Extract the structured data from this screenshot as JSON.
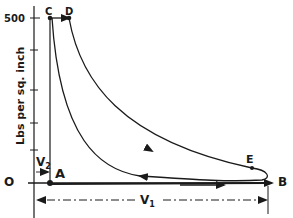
{
  "diagram": {
    "type": "pressure-volume indicator diagram",
    "y_axis": {
      "label": "Lbs per sq. inch",
      "tick_label_top": "500",
      "origin_label": "O"
    },
    "points": {
      "A": "A",
      "B": "B",
      "C": "C",
      "D": "D",
      "E": "E"
    },
    "dimensions": {
      "v1": "V",
      "v1_sub": "1",
      "v2": "V",
      "v2_sub": "2"
    },
    "colors": {
      "ink": "#1a1a1a",
      "background": "#ffffff"
    }
  }
}
